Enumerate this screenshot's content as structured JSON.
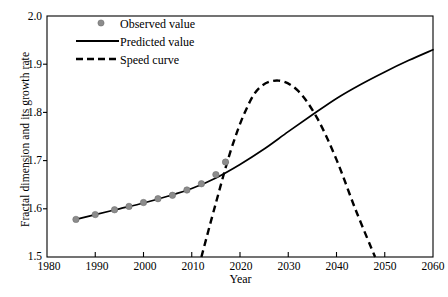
{
  "chart_data": {
    "type": "line",
    "title": "",
    "xlabel": "Year",
    "ylabel": "Fractal dimension and its growth rate",
    "xlim": [
      1980,
      2060
    ],
    "ylim": [
      1.5,
      2.0
    ],
    "xticks": [
      1980,
      1990,
      2000,
      2010,
      2020,
      2030,
      2040,
      2050,
      2060
    ],
    "yticks": [
      "1.5",
      "1.6",
      "1.7",
      "1.8",
      "1.9",
      "2.0"
    ],
    "grid": false,
    "legend_position": "top-center",
    "series": [
      {
        "name": "Observed value",
        "type": "scatter",
        "marker": "circle",
        "color": "#8c8c8c",
        "x": [
          1986,
          1990,
          1994,
          1997,
          2000,
          2003,
          2006,
          2009,
          2012,
          2015,
          2017
        ],
        "values": [
          1.578,
          1.588,
          1.598,
          1.605,
          1.613,
          1.621,
          1.628,
          1.639,
          1.652,
          1.671,
          1.697
        ]
      },
      {
        "name": "Predicted value",
        "type": "line",
        "style": "solid",
        "color": "#000000",
        "x": [
          1986,
          1990,
          1995,
          2000,
          2005,
          2010,
          2015,
          2020,
          2025,
          2030,
          2035,
          2040,
          2045,
          2050,
          2055,
          2060
        ],
        "values": [
          1.578,
          1.588,
          1.6,
          1.612,
          1.626,
          1.642,
          1.664,
          1.692,
          1.724,
          1.76,
          1.795,
          1.829,
          1.858,
          1.884,
          1.908,
          1.93
        ]
      },
      {
        "name": "Speed curve",
        "type": "line",
        "style": "dashed",
        "color": "#000000",
        "x": [
          2012,
          2015,
          2018,
          2021,
          2024,
          2028,
          2032,
          2036,
          2040,
          2044,
          2048
        ],
        "values": [
          1.5,
          1.612,
          1.718,
          1.8,
          1.851,
          1.866,
          1.845,
          1.788,
          1.702,
          1.597,
          1.5
        ]
      }
    ]
  },
  "legend": {
    "items": [
      {
        "label": "Observed value",
        "marker": "dot",
        "color": "#8c8c8c"
      },
      {
        "label": "Predicted value",
        "marker": "solid-line",
        "color": "#000000"
      },
      {
        "label": "Speed curve",
        "marker": "dashed-line",
        "color": "#000000"
      }
    ]
  },
  "axes": {
    "y_title": "Fractal dimension and its growth rate",
    "x_title": "Year",
    "y_tick_labels": [
      "2.0",
      "1.9",
      "1.8",
      "1.7",
      "1.6",
      "1.5"
    ],
    "x_tick_labels": [
      "1980",
      "1990",
      "2000",
      "2010",
      "2020",
      "2030",
      "2040",
      "2050",
      "2060"
    ]
  },
  "colors": {
    "axis": "#000000",
    "observed": "#8c8c8c",
    "predicted": "#000000",
    "speed": "#000000",
    "background": "#ffffff"
  }
}
